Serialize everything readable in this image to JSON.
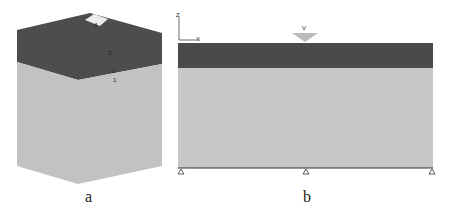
{
  "panel_a": {
    "caption": "a",
    "layer_labels": [
      "4",
      "3",
      "2",
      "1"
    ],
    "colors": {
      "top_layer": "#4d4d4d",
      "bottom_layer": "#c2c2c2",
      "footing": "#e8e8e8"
    }
  },
  "panel_b": {
    "caption": "b",
    "axis": {
      "z": "Z",
      "y": "Y"
    },
    "load_label": "V",
    "colors": {
      "top_layer": "#4a4a4a",
      "bottom_layer": "#c8c8c8"
    },
    "supports": 3
  }
}
